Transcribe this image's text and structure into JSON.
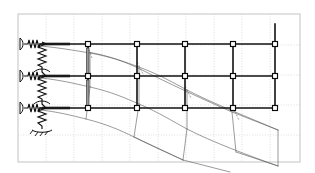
{
  "figure": {
    "title": "Deformed shape of three-bay three-storey frame with elastic supports",
    "background_color": "#ffffff",
    "border_color": "#b5b5b5",
    "undeformed_color": "#111111",
    "deformed_color": "#5d5d5d",
    "grid_color": "#c8c8c8",
    "node_marker": "square",
    "width_px": 315,
    "height_px": 173
  },
  "chart_data": {
    "type": "diagram",
    "title": "Deformed shape of three-bay three-storey frame with elastic supports",
    "xlabel": "",
    "ylabel": "",
    "xlim": [
      0,
      315
    ],
    "ylim": [
      0,
      173
    ],
    "grid": true,
    "legend_position": "none",
    "plot_area": {
      "x": 18,
      "y": 14,
      "width": 282,
      "height": 148
    },
    "grid_lines": {
      "vertical_x": [
        18,
        46,
        74,
        102,
        130,
        158,
        186,
        214,
        242,
        270,
        300
      ],
      "horizontal_y": [
        14,
        45,
        75,
        105,
        135,
        162
      ]
    },
    "structure": {
      "name": "undeformed-frame",
      "storey_levels_y": [
        44,
        76,
        108
      ],
      "bay_nodes_x": [
        40,
        88,
        137,
        185,
        233,
        275
      ],
      "beams": [
        {
          "level": "roof",
          "y": 44,
          "x_start": 40,
          "x_end": 275
        },
        {
          "level": "floor-2",
          "y": 76,
          "x_start": 40,
          "x_end": 275
        },
        {
          "level": "floor-1",
          "y": 108,
          "x_start": 40,
          "x_end": 275
        }
      ],
      "columns": [
        {
          "x": 88,
          "y_top": 44,
          "y_bottom": 108
        },
        {
          "x": 137,
          "y_top": 44,
          "y_bottom": 108
        },
        {
          "x": 185,
          "y_top": 44,
          "y_bottom": 108
        },
        {
          "x": 233,
          "y_top": 44,
          "y_bottom": 108
        },
        {
          "x": 275,
          "y_top": 44,
          "y_bottom": 108
        }
      ],
      "nodes": [
        {
          "x": 40,
          "y": 44
        },
        {
          "x": 88,
          "y": 44
        },
        {
          "x": 137,
          "y": 44
        },
        {
          "x": 185,
          "y": 44
        },
        {
          "x": 233,
          "y": 44
        },
        {
          "x": 275,
          "y": 44
        },
        {
          "x": 40,
          "y": 76
        },
        {
          "x": 88,
          "y": 76
        },
        {
          "x": 137,
          "y": 76
        },
        {
          "x": 185,
          "y": 76
        },
        {
          "x": 233,
          "y": 76
        },
        {
          "x": 275,
          "y": 76
        },
        {
          "x": 40,
          "y": 108
        },
        {
          "x": 88,
          "y": 108
        },
        {
          "x": 137,
          "y": 108
        },
        {
          "x": 185,
          "y": 108
        },
        {
          "x": 233,
          "y": 108
        },
        {
          "x": 275,
          "y": 108
        }
      ]
    },
    "supports": {
      "name": "elastic-spring-supports",
      "type": "horizontal-coil-spring-with-fixed-anchor",
      "count": 3,
      "locations": [
        {
          "node_x": 40,
          "node_y": 44,
          "anchor_x": 20
        },
        {
          "node_x": 40,
          "node_y": 76,
          "anchor_x": 20
        },
        {
          "node_x": 40,
          "node_y": 108,
          "anchor_x": 20
        }
      ],
      "vertical_spring_column": {
        "x": 42,
        "y_top": 42,
        "y_bottom": 128,
        "base_y": 130
      }
    },
    "deformed_mesh": {
      "name": "deformed-shape",
      "line_style": "thin-grey",
      "description": "Frame deflects downward and rotates clockwise toward the right end; curvature increases with distance from supports",
      "levels": [
        {
          "level": "roof",
          "points": [
            [
              41,
              46
            ],
            [
              90,
              52
            ],
            [
              139,
              60
            ],
            [
              187,
              70
            ],
            [
              235,
              82
            ],
            [
              278,
              96
            ]
          ]
        },
        {
          "level": "floor-2",
          "points": [
            [
              41,
              78
            ],
            [
              90,
              86
            ],
            [
              139,
              96
            ],
            [
              187,
              108
            ],
            [
              235,
              122
            ],
            [
              278,
              138
            ]
          ]
        },
        {
          "level": "floor-1",
          "points": [
            [
              41,
              110
            ],
            [
              90,
              119
            ],
            [
              139,
              130
            ],
            [
              187,
              144
            ],
            [
              235,
              158
            ],
            [
              278,
              170
            ]
          ]
        }
      ],
      "cross_members_x_index": [
        0,
        1,
        2,
        3,
        4,
        5
      ]
    }
  }
}
